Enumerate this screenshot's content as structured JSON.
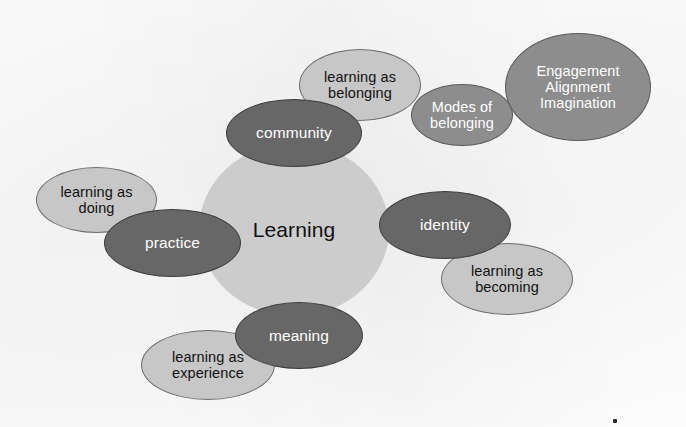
{
  "diagram": {
    "core": {
      "label": "Learning",
      "shade": "light-gray",
      "color": "#cccccc"
    },
    "palette": {
      "light_gray": "#c7c7c7",
      "mid_gray": "#8d8d8d",
      "dark_gray": "#676767",
      "outline": "#5a5a5a",
      "background": "#ffffff",
      "dark_text": "#111111",
      "light_text": "#ffffff"
    },
    "nodes": [
      {
        "id": "learning-as-doing",
        "label": "learning as\ndoing",
        "shade": "light",
        "x": 36,
        "y": 167,
        "w": 121,
        "h": 66,
        "font_size": 14.5,
        "z": 3
      },
      {
        "id": "practice",
        "label": "practice",
        "shade": "dark",
        "x": 104,
        "y": 209,
        "w": 137,
        "h": 68,
        "font_size": 15.5,
        "z": 6
      },
      {
        "id": "community",
        "label": "community",
        "shade": "dark",
        "x": 226,
        "y": 99,
        "w": 136,
        "h": 68,
        "font_size": 15.5,
        "z": 6
      },
      {
        "id": "learning-as-belonging",
        "label": "learning as\nbelonging",
        "shade": "light",
        "x": 299,
        "y": 49,
        "w": 122,
        "h": 72,
        "font_size": 14.5,
        "z": 4
      },
      {
        "id": "modes-of-belonging",
        "label": "Modes of\nbelonging",
        "shade": "mid",
        "x": 411,
        "y": 84,
        "w": 102,
        "h": 62,
        "font_size": 14.5,
        "z": 5
      },
      {
        "id": "engagement-alignment-imagination",
        "label": "Engagement\nAlignment\nImagination",
        "shade": "mid",
        "x": 505,
        "y": 33,
        "w": 146,
        "h": 108,
        "font_size": 14.5,
        "z": 6
      },
      {
        "id": "identity",
        "label": "identity",
        "shade": "dark",
        "x": 379,
        "y": 191,
        "w": 132,
        "h": 68,
        "font_size": 15.5,
        "z": 6
      },
      {
        "id": "learning-as-becoming",
        "label": "learning as\nbecoming",
        "shade": "light",
        "x": 441,
        "y": 243,
        "w": 132,
        "h": 72,
        "font_size": 14.5,
        "z": 4
      },
      {
        "id": "meaning",
        "label": "meaning",
        "shade": "dark",
        "x": 235,
        "y": 302,
        "w": 128,
        "h": 67,
        "font_size": 15.5,
        "z": 6
      },
      {
        "id": "learning-as-experience",
        "label": "learning as\nexperience",
        "shade": "light",
        "x": 141,
        "y": 330,
        "w": 134,
        "h": 70,
        "font_size": 14.5,
        "z": 4
      }
    ],
    "core_geometry": {
      "x": 199,
      "y": 143,
      "w": 190,
      "h": 173,
      "font_size": 21
    },
    "speck": {
      "x": 613,
      "y": 419
    }
  }
}
